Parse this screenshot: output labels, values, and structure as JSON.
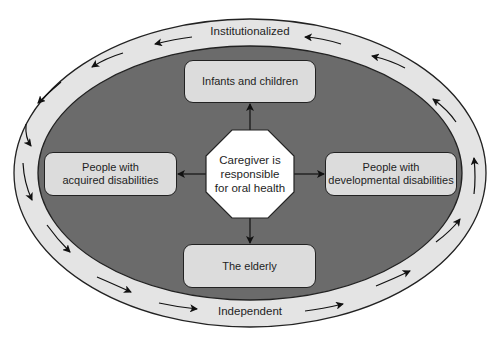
{
  "diagram": {
    "outer_ring": {
      "top_label": "Institutionalized",
      "bottom_label": "Independent",
      "fill": "#e4e4e4",
      "flow_direction": "counterclockwise from top-right to left, then left-to-right along bottom, up the right side"
    },
    "inner_area": {
      "fill": "#6b6b6b"
    },
    "center": {
      "shape": "octagon",
      "lines": [
        "Caregiver is",
        "responsible",
        "for oral health"
      ],
      "fill": "#ffffff"
    },
    "boxes": {
      "top": "Infants and children",
      "left_line1": "People with",
      "left_line2": "acquired disabilities",
      "right_line1": "People with",
      "right_line2": "developmental disabilities",
      "bottom": "The elderly",
      "fill": "#dcdcdc"
    }
  }
}
